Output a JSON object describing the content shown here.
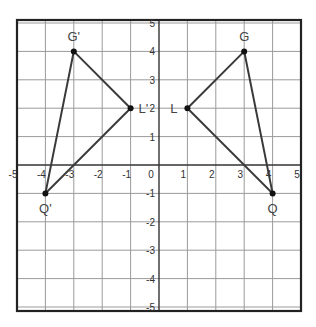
{
  "diagram": {
    "type": "coordinate-plane-reflection",
    "grid": {
      "x_range": [
        -5,
        5
      ],
      "y_range": [
        -5,
        5
      ],
      "step": 1,
      "origin_px": [
        159,
        165
      ],
      "unit_px": 28.4,
      "bounds_px": {
        "left": 17,
        "top": 20,
        "right": 301,
        "bottom": 311
      }
    },
    "x_tick_labels": [
      "-5",
      "-4",
      "-3",
      "-2",
      "-1",
      "0",
      "1",
      "2",
      "3",
      "4",
      "5"
    ],
    "y_tick_labels": [
      "5",
      "4",
      "3",
      "2",
      "1",
      "-1",
      "-2",
      "-3",
      "-4",
      "-5"
    ],
    "triangles": [
      {
        "name": "GLQ",
        "points": [
          {
            "label": "G",
            "x": 3,
            "y": 4
          },
          {
            "label": "L",
            "x": 1,
            "y": 2
          },
          {
            "label": "Q",
            "x": 4,
            "y": -1
          }
        ]
      },
      {
        "name": "G'L'Q'",
        "points": [
          {
            "label": "G'",
            "x": -3,
            "y": 4
          },
          {
            "label": "L'",
            "x": -1,
            "y": 2
          },
          {
            "label": "Q'",
            "x": -4,
            "y": -1
          }
        ]
      }
    ],
    "colors": {
      "grid_line": "#9a9a9a",
      "axis": "#333333",
      "border": "#222222",
      "triangle": "#3a3a3a",
      "point": "#111111",
      "label": "#444444"
    }
  }
}
